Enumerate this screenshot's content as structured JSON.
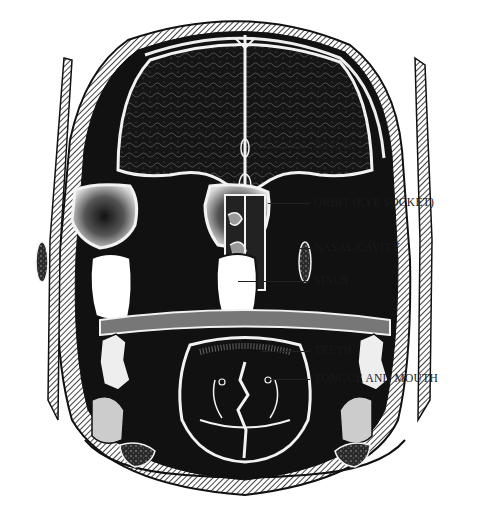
{
  "figure": {
    "labels": [
      {
        "id": "brain",
        "text": "BRAIN"
      },
      {
        "id": "orbit",
        "text": "ORBIT (EYE SOCKET)"
      },
      {
        "id": "nasal-cavity",
        "text": "NASAL CAVITY"
      },
      {
        "id": "sinus",
        "text": "SINUS"
      },
      {
        "id": "teeth",
        "text": "TEETH"
      },
      {
        "id": "tongue-and-mouth",
        "text": "TONGUE AND MOUTH"
      }
    ]
  }
}
